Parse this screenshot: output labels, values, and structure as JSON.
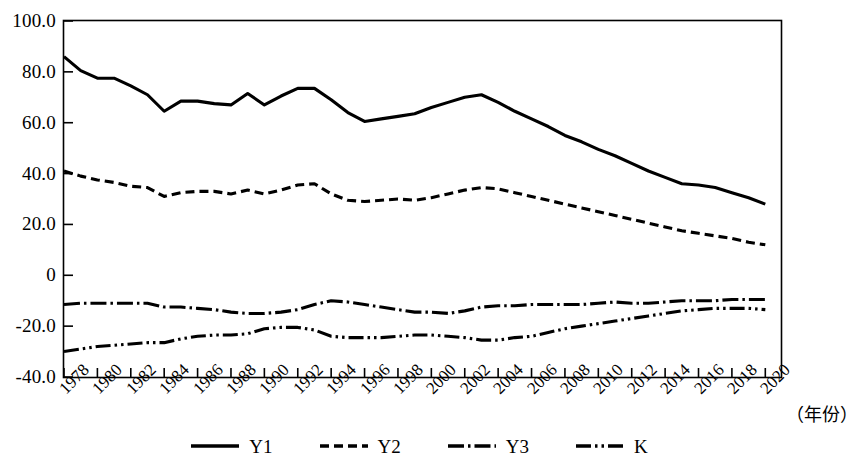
{
  "chart_data": {
    "type": "line",
    "title": "",
    "xlabel": "（年份）",
    "ylabel": "",
    "xlim": [
      1978,
      2021
    ],
    "ylim": [
      -40,
      100
    ],
    "grid": false,
    "legend_position": "bottom-center",
    "x": [
      1978,
      1979,
      1980,
      1981,
      1982,
      1983,
      1984,
      1985,
      1986,
      1987,
      1988,
      1989,
      1990,
      1991,
      1992,
      1993,
      1994,
      1995,
      1996,
      1997,
      1998,
      1999,
      2000,
      2001,
      2002,
      2003,
      2004,
      2005,
      2006,
      2007,
      2008,
      2009,
      2010,
      2011,
      2012,
      2013,
      2014,
      2015,
      2016,
      2017,
      2018,
      2019,
      2020
    ],
    "y_tick_labels": [
      "100.0",
      "80.0",
      "60.0",
      "40.0",
      "20.0",
      "0",
      "-20.0",
      "-40.0"
    ],
    "y_tick_values": [
      100,
      80,
      60,
      40,
      20,
      0,
      -20,
      -40
    ],
    "x_tick_labels": [
      "1978",
      "1980",
      "1982",
      "1984",
      "1986",
      "1988",
      "1990",
      "1992",
      "1994",
      "1996",
      "1998",
      "2000",
      "2002",
      "2004",
      "2006",
      "2008",
      "2010",
      "2012",
      "2014",
      "2016",
      "2018",
      "2020"
    ],
    "x_tick_values": [
      1978,
      1980,
      1982,
      1984,
      1986,
      1988,
      1990,
      1992,
      1994,
      1996,
      1998,
      2000,
      2002,
      2004,
      2006,
      2008,
      2010,
      2012,
      2014,
      2016,
      2018,
      2020
    ],
    "series": [
      {
        "name": "Y1",
        "style": "solid",
        "color": "#000000",
        "values": [
          86.0,
          80.5,
          77.5,
          77.5,
          74.5,
          71.0,
          64.5,
          68.5,
          68.5,
          67.5,
          67.0,
          71.5,
          67.0,
          70.5,
          73.5,
          73.5,
          69.0,
          64.0,
          60.5,
          61.5,
          62.5,
          63.5,
          66.0,
          68.0,
          70.0,
          71.0,
          68.0,
          64.5,
          61.5,
          58.5,
          55.0,
          52.5,
          49.5,
          47.0,
          44.0,
          41.0,
          38.5,
          36.0,
          35.5,
          34.5,
          32.5,
          30.5,
          28.0
        ]
      },
      {
        "name": "Y2",
        "style": "dotted",
        "color": "#000000",
        "values": [
          41.0,
          39.0,
          37.5,
          36.5,
          35.0,
          34.5,
          31.0,
          32.5,
          33.0,
          33.0,
          32.0,
          33.5,
          32.0,
          33.5,
          35.5,
          36.0,
          32.0,
          29.5,
          29.0,
          29.5,
          30.0,
          29.5,
          30.5,
          32.0,
          33.5,
          34.5,
          34.0,
          32.5,
          31.0,
          29.5,
          28.0,
          26.5,
          25.0,
          23.5,
          22.0,
          20.5,
          19.0,
          17.5,
          16.5,
          15.5,
          14.5,
          13.0,
          12.0
        ]
      },
      {
        "name": "Y3",
        "style": "dashdot",
        "color": "#000000",
        "values": [
          -11.5,
          -11.0,
          -11.0,
          -11.0,
          -11.0,
          -11.0,
          -12.5,
          -12.5,
          -13.0,
          -13.5,
          -14.5,
          -15.0,
          -15.0,
          -14.5,
          -13.5,
          -11.5,
          -10.0,
          -10.5,
          -11.5,
          -12.5,
          -13.5,
          -14.5,
          -14.5,
          -15.0,
          -14.0,
          -12.5,
          -12.0,
          -12.0,
          -11.5,
          -11.5,
          -11.5,
          -11.5,
          -11.0,
          -10.5,
          -11.0,
          -11.0,
          -10.5,
          -10.0,
          -10.0,
          -10.0,
          -9.5,
          -9.5,
          -9.5
        ]
      },
      {
        "name": "K",
        "style": "dashdotdot",
        "color": "#000000",
        "values": [
          -30.0,
          -29.0,
          -28.0,
          -27.5,
          -27.0,
          -26.5,
          -26.5,
          -25.0,
          -24.0,
          -23.5,
          -23.5,
          -23.0,
          -21.0,
          -20.5,
          -20.5,
          -21.5,
          -24.0,
          -24.5,
          -24.5,
          -24.5,
          -24.0,
          -23.5,
          -23.5,
          -24.0,
          -24.5,
          -25.5,
          -25.5,
          -24.5,
          -24.0,
          -22.5,
          -21.0,
          -20.0,
          -19.0,
          -18.0,
          -17.0,
          -16.0,
          -15.0,
          -14.0,
          -13.5,
          -13.0,
          -13.0,
          -13.0,
          -13.5
        ]
      }
    ]
  },
  "legend": {
    "items": [
      {
        "label": "Y1",
        "style": "solid"
      },
      {
        "label": "Y2",
        "style": "dotted"
      },
      {
        "label": "Y3",
        "style": "dashdot"
      },
      {
        "label": "K",
        "style": "dashdotdot"
      }
    ]
  },
  "axis_unit_label": "（年份）"
}
